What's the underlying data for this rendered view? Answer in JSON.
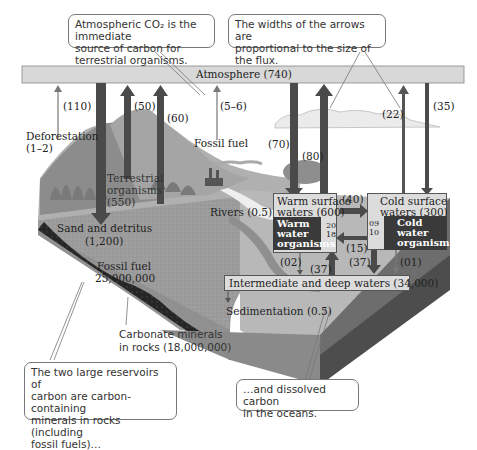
{
  "colors": {
    "atmosphere_bar": "#d8d8d8",
    "arrow_dark": "#4a4a4a",
    "arrow_light": "#8a8a8a",
    "land": "#9a9a9a",
    "rock_dark": "#222222",
    "ocean": "#b5b5b5",
    "ocean_side": "#6e6e6e",
    "organisms_box": "#3a3a3a",
    "water_box": "#dcdcdc"
  },
  "callouts": {
    "atmospheric_co2": {
      "line1": "Atmospheric CO₂ is the immediate",
      "line2": "source of carbon for terrestrial organisms."
    },
    "arrow_widths": {
      "line1": "The widths of the arrows are",
      "line2": "proportional to the size of the flux."
    },
    "large_reservoirs": {
      "line1": "The two large reservoirs of",
      "line2": "carbon are carbon-containing",
      "line3": "minerals in rocks (including",
      "line4": "fossil fuels)…"
    },
    "dissolved_carbon": {
      "line1": "…and dissolved carbon",
      "line2": "in the oceans."
    }
  },
  "atmosphere": {
    "label": "Atmosphere (740)"
  },
  "fluxes": {
    "f110": "(110)",
    "f50": "(50)",
    "f60": "(60)",
    "f5_6": "(5–6)",
    "f70": "(70)",
    "f80": "(80)",
    "f22": "(22)",
    "f35": "(35)",
    "f40": "(40)",
    "f15": "(15)",
    "f02": "(02)",
    "f37a": "(37)",
    "f37b": "(37)",
    "f01": "(01)",
    "warm_in": "20",
    "warm_out": "18",
    "cold_in": "09",
    "cold_out": "10"
  },
  "labels": {
    "deforestation": "Deforestation",
    "deforestation_value": "(1–2)",
    "fossil_fuel_emission": "Fossil fuel",
    "terrestrial_line1": "Terrestrial",
    "terrestrial_line2": "organisms",
    "terrestrial_value": "(550)",
    "rivers": "Rivers (0.5)",
    "sand_detritus": "Sand and detritus",
    "sand_detritus_value": "(1,200)",
    "fossil_fuel_reservoir": "Fossil fuel",
    "fossil_fuel_value": "25,000,000",
    "carbonate_line1": "Carbonate minerals",
    "carbonate_line2": "in rocks (18,000,000)",
    "sedimentation": "Sedimentation (0.5)",
    "warm_surface_line1": "Warm surface",
    "warm_surface_line2": "waters (600)",
    "warm_org_line1": "Warm",
    "warm_org_line2": "water",
    "warm_org_line3": "organisms",
    "cold_surface_line1": "Cold surface",
    "cold_surface_line2": "waters (300)",
    "cold_org_line1": "Cold",
    "cold_org_line2": "water",
    "cold_org_line3": "organisms",
    "deep_waters": "Intermediate and deep waters (34,000)"
  }
}
